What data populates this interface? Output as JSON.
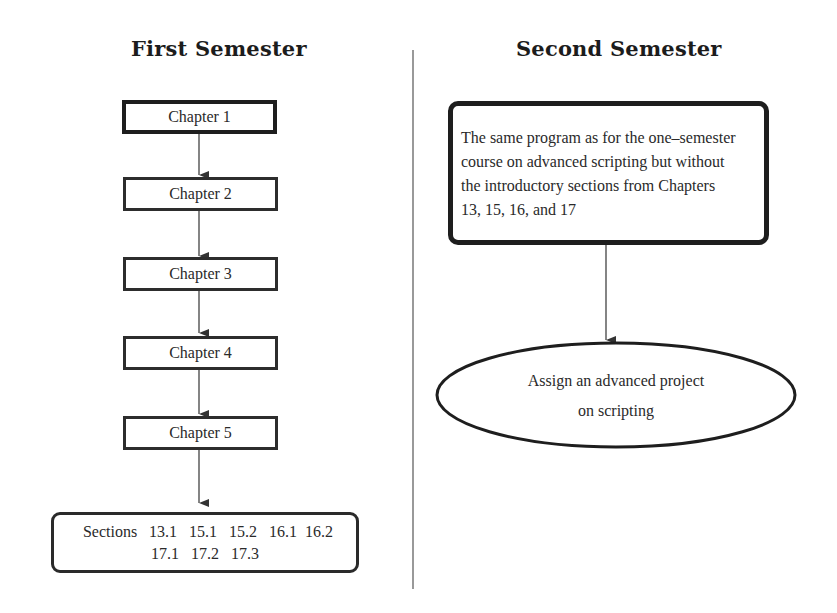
{
  "left_column": {
    "title": "First Semester",
    "chapters": [
      {
        "label": "Chapter 1"
      },
      {
        "label": "Chapter 2"
      },
      {
        "label": "Chapter 3"
      },
      {
        "label": "Chapter 4"
      },
      {
        "label": "Chapter 5"
      }
    ],
    "sections_box": {
      "line1": "Sections   13.1   15.1   15.2   16.1  16.2",
      "line2": "17.1   17.2   17.3"
    }
  },
  "right_column": {
    "title": "Second Semester",
    "program_box": {
      "lines": [
        "The same program as for the one–semester",
        "course on advanced scripting but without",
        "the introductory sections from Chapters",
        "13, 15, 16, and 17"
      ]
    },
    "project_ellipse": {
      "line1": "Assign an advanced project",
      "line2": "on scripting"
    }
  },
  "colors": {
    "line": "#2a2a2a",
    "divider": "#555555",
    "background": "#ffffff"
  }
}
